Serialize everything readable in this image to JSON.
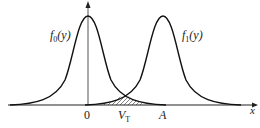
{
  "figure": {
    "curve0_label": "f",
    "curve0_sub": "0",
    "curve0_arg": "(y)",
    "curve1_label": "f",
    "curve1_sub": "1",
    "curve1_arg": "(y)",
    "origin_label": "0",
    "threshold_label": "V",
    "threshold_sub": "T",
    "mean_label": "A",
    "x_axis_label": "x"
  },
  "colors": {
    "stroke": "#222222",
    "background": "#ffffff"
  }
}
